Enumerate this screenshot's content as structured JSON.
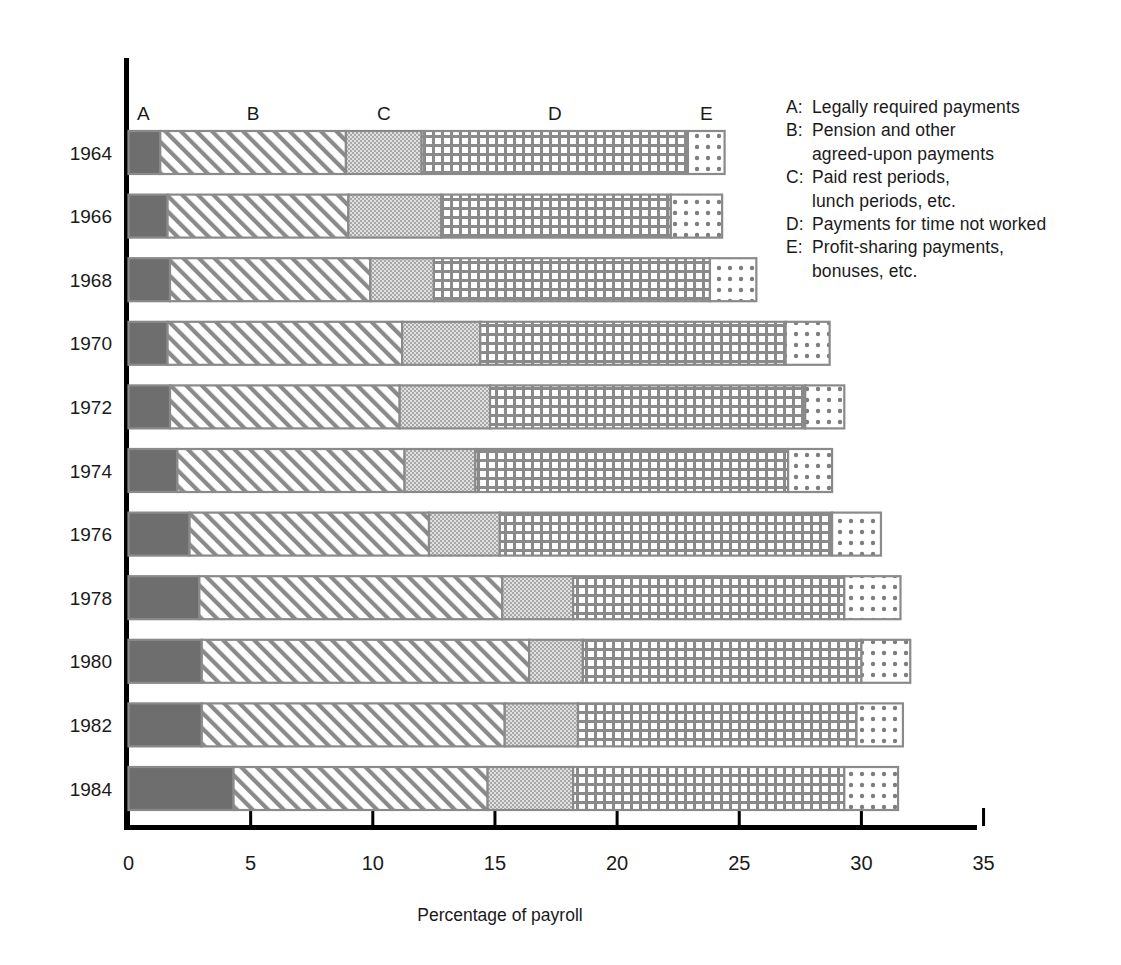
{
  "chart_data": {
    "type": "bar",
    "subtype": "horizontal-stacked",
    "title": "",
    "xlabel": "Percentage of payroll",
    "ylabel": "",
    "xlim": [
      0,
      37
    ],
    "grid": false,
    "xticks": [
      0,
      5,
      10,
      15,
      20,
      25,
      30,
      35
    ],
    "xtick_labels": [
      "0",
      "5",
      "10",
      "15",
      "20",
      "25",
      "30",
      "35"
    ],
    "categories": [
      "1964",
      "1966",
      "1968",
      "1970",
      "1972",
      "1974",
      "1976",
      "1978",
      "1980",
      "1982",
      "1984"
    ],
    "segment_keys": [
      "A",
      "B",
      "C",
      "D",
      "E"
    ],
    "segment_top_labels": [
      "A",
      "B",
      "C",
      "D",
      "E"
    ],
    "legend_position": "right",
    "series": [
      {
        "name": "A",
        "label": "Legally required payments",
        "values": [
          1.3,
          1.6,
          1.7,
          1.6,
          1.7,
          2.0,
          2.5,
          2.9,
          3.0,
          3.0,
          4.3
        ]
      },
      {
        "name": "B",
        "label": "Pension and other agreed-upon payments",
        "values": [
          7.6,
          7.4,
          8.2,
          9.6,
          9.4,
          9.3,
          9.8,
          12.4,
          13.4,
          12.4,
          10.4
        ]
      },
      {
        "name": "C",
        "label": "Paid rest periods, lunch periods, etc.",
        "values": [
          3.1,
          3.8,
          2.6,
          3.2,
          3.7,
          2.9,
          2.9,
          2.9,
          2.2,
          3.0,
          3.5
        ]
      },
      {
        "name": "D",
        "label": "Payments for time not worked",
        "values": [
          10.9,
          9.4,
          11.3,
          12.5,
          12.9,
          12.8,
          13.6,
          11.1,
          11.4,
          11.4,
          11.1
        ]
      },
      {
        "name": "E",
        "label": "Profit-sharing payments, bonuses, etc.",
        "values": [
          1.5,
          2.1,
          1.9,
          1.8,
          1.6,
          1.8,
          2.0,
          2.3,
          2.0,
          1.9,
          2.2
        ]
      }
    ],
    "totals": [
      24.4,
      24.3,
      25.7,
      28.7,
      29.3,
      28.8,
      30.8,
      31.6,
      32.0,
      31.7,
      31.5
    ]
  },
  "legend": {
    "entries": [
      {
        "key": "A:",
        "line1": "Legally required payments",
        "line2": ""
      },
      {
        "key": "B:",
        "line1": "Pension and other",
        "line2": "agreed-upon payments"
      },
      {
        "key": "C:",
        "line1": "Paid rest periods,",
        "line2": "lunch periods, etc."
      },
      {
        "key": "D:",
        "line1": "Payments for time not worked",
        "line2": ""
      },
      {
        "key": "E:",
        "line1": "Profit-sharing payments,",
        "line2": "bonuses, etc."
      }
    ]
  },
  "axis": {
    "x_title": "Percentage of payroll"
  },
  "colors": {
    "segment_a": "#6e6e6e",
    "segment_b": "#ffffff",
    "segment_c": "#c9c9c9",
    "segment_d": "#ffffff",
    "segment_e": "#ffffff",
    "outline": "#808080",
    "axis": "#000000",
    "text": "#1a1a1a"
  }
}
